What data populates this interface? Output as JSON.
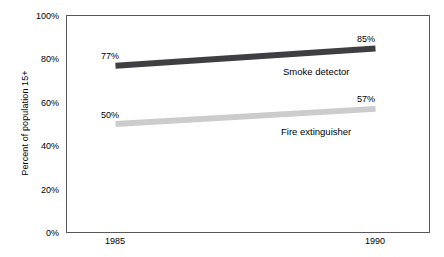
{
  "chart_data": {
    "type": "line",
    "title": "",
    "subtitle": "",
    "xlabel": "",
    "ylabel": "Percent of population 15+",
    "x": [
      1985,
      1990
    ],
    "x_tick_labels": [
      "1985",
      "1990"
    ],
    "xlim": [
      1984,
      1991
    ],
    "ylim": [
      0,
      100
    ],
    "y_tick_labels": [
      "0%",
      "20%",
      "40%",
      "60%",
      "80%",
      "100%"
    ],
    "y_ticks": [
      0,
      20,
      40,
      60,
      80,
      100
    ],
    "grid": false,
    "legend_position": "inline-right-of-line",
    "series": [
      {
        "name": "Smoke detector",
        "label": "Smoke detector",
        "color": "#3f3f41",
        "values": [
          77,
          85
        ],
        "point_labels": [
          "77%",
          "85%"
        ]
      },
      {
        "name": "Fire extinguisher",
        "label": "Fire extinguisher",
        "color": "#cccccc",
        "values": [
          50,
          57
        ],
        "point_labels": [
          "50%",
          "57%"
        ]
      }
    ]
  },
  "axes": {
    "y_title": "Percent of population 15+",
    "y_labels": {
      "t100": "100%",
      "t80": "80%",
      "t60": "60%",
      "t40": "40%",
      "t20": "20%",
      "t0": "0%"
    },
    "x_labels": {
      "left": "1985",
      "right": "1990"
    },
    "frame_color": "#58585a",
    "tick_color": "#58585a"
  },
  "annotations": {
    "smoke_start": "77%",
    "smoke_end": "85%",
    "fire_start": "50%",
    "fire_end": "57%",
    "smoke_series_label": "Smoke detector",
    "fire_series_label": "Fire extinguisher"
  }
}
